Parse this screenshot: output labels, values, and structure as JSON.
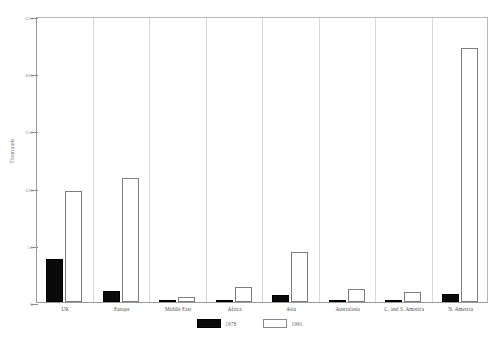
{
  "top_note": "",
  "chart_data": {
    "type": "bar",
    "title": "",
    "xlabel": "",
    "ylabel": "Thousands",
    "ylim": [
      0,
      250
    ],
    "yticks": [
      0,
      50,
      100,
      150,
      200,
      250
    ],
    "ytick_labels": [
      "0",
      "50",
      "100",
      "150",
      "200",
      "250"
    ],
    "grid": false,
    "legend_position": "bottom",
    "categories": [
      "UK",
      "Europe",
      "Middle East",
      "Africa",
      "Asia",
      "Australasia",
      "C. and S. America",
      "N. America"
    ],
    "series": [
      {
        "name": "1978",
        "color": "#0a0a0a",
        "values": [
          38,
          10,
          2,
          2,
          6,
          1,
          1,
          7
        ]
      },
      {
        "name": "1991",
        "color": "#ffffff",
        "values": [
          97,
          108,
          4,
          13,
          44,
          11,
          9,
          222
        ]
      }
    ]
  },
  "legend": {
    "items": [
      {
        "label": "1978",
        "swatch": "black"
      },
      {
        "label": "1991",
        "swatch": "white"
      }
    ]
  },
  "axis": {
    "y_title": "Thousands"
  }
}
